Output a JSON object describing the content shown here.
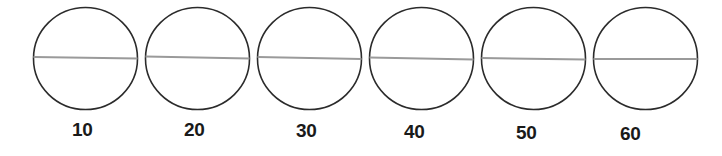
{
  "figure": {
    "title": "",
    "background_color": "#ffffff",
    "circle_stroke_color": "#2b2b2b",
    "circle_stroke_width": 1.6,
    "diameter_line_color": "#9a9a9a",
    "diameter_line_width": 2,
    "label_color": "#1a1a1a",
    "circle_count": 6
  },
  "chart_data": {
    "type": "scatter",
    "title": "",
    "xlabel": "",
    "ylabel": "",
    "categories": [
      "10",
      "20",
      "30",
      "40",
      "50",
      "60"
    ],
    "values": [
      10,
      20,
      30,
      40,
      50,
      60
    ],
    "annotations": [
      "Six identical circles each bisected by a near-horizontal diameter line",
      "Labels 10 through 60 placed beneath each circle"
    ],
    "series": [
      {
        "name": "circles",
        "values": [
          10,
          20,
          30,
          40,
          50,
          60
        ]
      }
    ],
    "grid": false,
    "legend": "none"
  },
  "circles": [
    {
      "label": "10",
      "cx": 85.5,
      "cy": 58.5,
      "rx": 52,
      "ry": 51,
      "line_y_left": 57,
      "line_y_right": 58.5,
      "label_x": 72,
      "label_y": 120
    },
    {
      "label": "20",
      "cx": 197.5,
      "cy": 58.5,
      "rx": 52,
      "ry": 51,
      "line_y_left": 56.5,
      "line_y_right": 58.5,
      "label_x": 184,
      "label_y": 120
    },
    {
      "label": "30",
      "cx": 309.5,
      "cy": 58.5,
      "rx": 52,
      "ry": 51,
      "line_y_left": 57,
      "line_y_right": 59,
      "label_x": 296,
      "label_y": 121
    },
    {
      "label": "40",
      "cx": 421.5,
      "cy": 58.5,
      "rx": 52,
      "ry": 51,
      "line_y_left": 57.5,
      "line_y_right": 59.5,
      "label_x": 404,
      "label_y": 122
    },
    {
      "label": "50",
      "cx": 533.5,
      "cy": 58.5,
      "rx": 52,
      "ry": 51,
      "line_y_left": 58,
      "line_y_right": 59.5,
      "label_x": 516,
      "label_y": 123
    },
    {
      "label": "60",
      "cx": 645.5,
      "cy": 58.5,
      "rx": 52,
      "ry": 51,
      "line_y_left": 59,
      "line_y_right": 59,
      "label_x": 620,
      "label_y": 124
    }
  ]
}
